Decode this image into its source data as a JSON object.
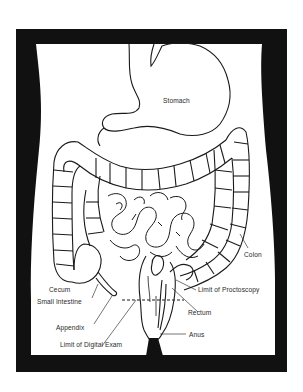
{
  "figure": {
    "frame_color": "#111111",
    "background_color": "#ffffff",
    "line_color": "#1a1a1a"
  },
  "labels": {
    "stomach": "Stomach",
    "colon": "Colon",
    "cecum": "Cecum",
    "small_intestine": "Small Intestine",
    "limit_proctoscopy": "Limit of Proctoscopy",
    "appendix": "Appendix",
    "rectum": "Rectum",
    "anus": "Anus",
    "limit_digital_exam": "Limit of Digital Exam"
  }
}
